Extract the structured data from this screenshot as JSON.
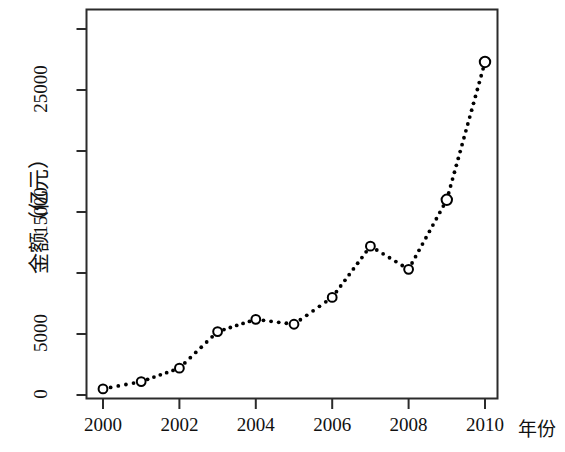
{
  "chart_data": {
    "type": "line",
    "title": "",
    "subtitle": "",
    "xlabel": "年份",
    "ylabel": "金额（亿元）",
    "x": [
      2000,
      2001,
      2002,
      2003,
      2004,
      2005,
      2006,
      2007,
      2008,
      2009,
      2010
    ],
    "values": [
      500,
      1100,
      2200,
      5200,
      6200,
      5800,
      8000,
      12200,
      10300,
      16000,
      27300
    ],
    "series": [
      {
        "name": "金额（亿元）",
        "values": [
          500,
          1100,
          2200,
          5200,
          6200,
          5800,
          8000,
          12200,
          10300,
          16000,
          27300
        ]
      }
    ],
    "xlim": [
      1999.5,
      2010.9
    ],
    "ylim": [
      -1400,
      29000
    ],
    "xticks": [
      2000,
      2002,
      2004,
      2006,
      2008,
      2010
    ],
    "xticklabels": [
      "2000",
      "2002",
      "2004",
      "2006",
      "2008",
      "2010"
    ],
    "yticks": [
      0,
      5000,
      10000,
      15000,
      20000,
      25000,
      30000
    ],
    "yticklabels": [
      "0",
      "5000",
      "",
      "15000",
      "",
      "25000",
      ""
    ],
    "ytick_labeled": [
      0,
      5000,
      15000,
      25000
    ],
    "grid": false,
    "legend": "none",
    "linestyle": "dotted",
    "marker": "circle-open",
    "line_color": "#000000",
    "marker_color": "#000000",
    "background_color": "#ffffff",
    "axis_color": "#333333"
  },
  "axis": {
    "y_title": "金额（亿元）",
    "x_title": "年份",
    "y_labels": [
      "0",
      "5000",
      "15000",
      "25000"
    ],
    "x_labels": [
      "2000",
      "2002",
      "2004",
      "2006",
      "2008",
      "2010"
    ]
  }
}
